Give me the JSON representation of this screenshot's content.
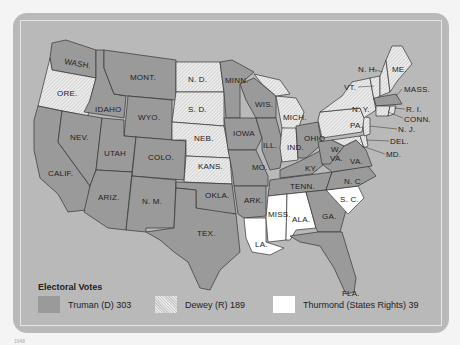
{
  "legend": {
    "title": "Electoral Votes",
    "items": [
      {
        "label": "Truman (D) 303",
        "party": "truman",
        "color": "#9a9a9a"
      },
      {
        "label": "Dewey (R) 189",
        "party": "dewey",
        "pattern": "hatched"
      },
      {
        "label": "Thurmond (States Rights) 39",
        "party": "thurmond",
        "color": "#ffffff"
      }
    ]
  },
  "states": {
    "wash": "WASH.",
    "ore": "ORE.",
    "calif": "CALIF.",
    "idaho": "IDAHO",
    "nev": "NEV.",
    "mont": "MONT.",
    "wyo": "WYO.",
    "utah": "UTAH",
    "colo": "COLO.",
    "ariz": "ARIZ.",
    "nm": "N. M.",
    "nd": "N. D.",
    "sd": "S. D.",
    "neb": "NEB.",
    "kans": "KANS.",
    "okla": "OKLA.",
    "tex": "TEX.",
    "minn": "MINN.",
    "iowa": "IOWA",
    "mo": "MO.",
    "ark": "ARK.",
    "la": "LA.",
    "wis": "WIS.",
    "ill": "ILL.",
    "mich": "MICH.",
    "ind": "IND.",
    "ohio": "OHIO",
    "ky": "KY.",
    "tenn": "TENN.",
    "miss": "MISS.",
    "ala": "ALA.",
    "ga": "GA.",
    "fla": "FLA.",
    "sc": "S. C.",
    "nc": "N. C.",
    "va": "VA.",
    "wva_w": "W.",
    "wva_va": "VA.",
    "md": "MD.",
    "del": "DEL.",
    "nj": "N. J.",
    "pa": "PA.",
    "ny": "N. Y.",
    "vt": "VT.",
    "nh": "N. H.",
    "me": "ME.",
    "mass": "MASS.",
    "ri": "R. I.",
    "conn": "CONN."
  },
  "caption": "1948"
}
